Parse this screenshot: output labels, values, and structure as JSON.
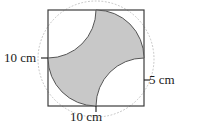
{
  "figure": {
    "type": "geometry-diagram",
    "colors": {
      "background": "#ffffff",
      "outline": "#3c3c3c",
      "star_fill": "#c8c8c8",
      "star_stroke": "#555555",
      "dotted_circle": "#c0c0c0",
      "text": "#1a1a1a"
    },
    "square": {
      "name": "outer-square",
      "side_px": 96,
      "x": 48,
      "y": 10
    },
    "arcs": {
      "radius_px": 48,
      "count": 4,
      "centered_at": "square-corners"
    },
    "dotted_circle": {
      "center_x": 96,
      "center_y": 58,
      "radius_px": 58
    }
  },
  "labels": {
    "left": "10 cm",
    "bottom": "10 cm",
    "right": "5 cm"
  },
  "ticks": {
    "left_tick": "left-side-tick",
    "bottom_tick": "bottom-side-tick",
    "right_tick": "right-side-tick"
  }
}
